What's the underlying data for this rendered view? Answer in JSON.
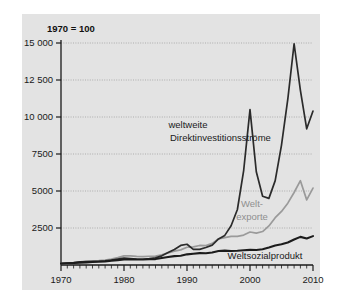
{
  "chart_data": {
    "type": "line",
    "title": "",
    "subtitle": "",
    "unit_note": "1970 = 100",
    "xlabel": "",
    "ylabel": "",
    "xlim": [
      1970,
      2010
    ],
    "ylim": [
      0,
      15000
    ],
    "grid": true,
    "legend_position": "inline-annotations",
    "x_ticks": [
      1970,
      1980,
      1990,
      2000,
      2010
    ],
    "x_tick_labels": [
      "1970",
      "1980",
      "1990",
      "2000",
      "2010"
    ],
    "x_minor_tick_step": 1,
    "y_ticks": [
      2500,
      5000,
      7500,
      10000,
      12500,
      15000
    ],
    "y_tick_labels": [
      "2500",
      "5000",
      "7500",
      "10 000",
      "12 500",
      "15 000"
    ],
    "series": [
      {
        "name": "weltweite Direktinvestitionsströme",
        "label_lines": [
          "weltweite",
          "Direktinvestitionsströme"
        ],
        "color": "#2b2b2b",
        "x": [
          1970,
          1971,
          1972,
          1973,
          1974,
          1975,
          1976,
          1977,
          1978,
          1979,
          1980,
          1981,
          1982,
          1983,
          1984,
          1985,
          1986,
          1987,
          1988,
          1989,
          1990,
          1991,
          1992,
          1993,
          1994,
          1995,
          1996,
          1997,
          1998,
          1999,
          2000,
          2001,
          2002,
          2003,
          2004,
          2005,
          2006,
          2007,
          2008,
          2009,
          2010
        ],
        "y": [
          100,
          130,
          165,
          215,
          230,
          245,
          255,
          275,
          330,
          400,
          460,
          430,
          400,
          390,
          430,
          480,
          620,
          840,
          1050,
          1320,
          1400,
          1060,
          1060,
          1180,
          1340,
          1760,
          2000,
          2650,
          3750,
          6400,
          10500,
          6300,
          4650,
          4500,
          5700,
          8100,
          11200,
          14950,
          11800,
          9200,
          10400
        ]
      },
      {
        "name": "Weltexporte",
        "label_lines": [
          "Welt-",
          "exporte"
        ],
        "color": "#9a9a9a",
        "x": [
          1970,
          1971,
          1972,
          1973,
          1974,
          1975,
          1976,
          1977,
          1978,
          1979,
          1980,
          1981,
          1982,
          1983,
          1984,
          1985,
          1986,
          1987,
          1988,
          1989,
          1990,
          1991,
          1992,
          1993,
          1994,
          1995,
          1996,
          1997,
          1998,
          1999,
          2000,
          2001,
          2002,
          2003,
          2004,
          2005,
          2006,
          2007,
          2008,
          2009,
          2010
        ],
        "y": [
          100,
          115,
          135,
          185,
          255,
          270,
          295,
          335,
          400,
          500,
          620,
          610,
          580,
          570,
          590,
          600,
          690,
          820,
          940,
          1020,
          1200,
          1230,
          1320,
          1310,
          1460,
          1760,
          1850,
          1930,
          1940,
          2020,
          2230,
          2150,
          2260,
          2640,
          3200,
          3620,
          4180,
          4900,
          5700,
          4400,
          5200
        ]
      },
      {
        "name": "Weltsozialprodukt",
        "label_lines": [
          "Weltsozialprodukt"
        ],
        "color": "#1c1c1c",
        "x": [
          1970,
          1971,
          1972,
          1973,
          1974,
          1975,
          1976,
          1977,
          1978,
          1979,
          1980,
          1981,
          1982,
          1983,
          1984,
          1985,
          1986,
          1987,
          1988,
          1989,
          1990,
          1991,
          1992,
          1993,
          1994,
          1995,
          1996,
          1997,
          1998,
          1999,
          2000,
          2001,
          2002,
          2003,
          2004,
          2005,
          2006,
          2007,
          2008,
          2009,
          2010
        ],
        "y": [
          100,
          115,
          132,
          160,
          180,
          200,
          215,
          240,
          285,
          330,
          375,
          375,
          370,
          375,
          385,
          400,
          470,
          540,
          600,
          630,
          720,
          760,
          800,
          790,
          840,
          950,
          970,
          950,
          960,
          1000,
          1020,
          1010,
          1060,
          1180,
          1320,
          1400,
          1520,
          1720,
          1900,
          1790,
          1950
        ]
      }
    ],
    "annotations": [
      {
        "name": "fdi-label",
        "text_lines": [
          "weltweite",
          "Direktinvestitionsströme"
        ],
        "color": "#1a1a1a"
      },
      {
        "name": "exports-label",
        "text_lines": [
          "Welt-",
          "exporte"
        ],
        "color": "#8f8f8f"
      },
      {
        "name": "gdp-label",
        "text_lines": [
          "Weltsozialprodukt"
        ],
        "color": "#1a1a1a"
      }
    ]
  },
  "labels": {
    "unit_note": "1970 = 100",
    "y": {
      "t2500": "2500",
      "t5000": "5000",
      "t7500": "7500",
      "t10000": "10 000",
      "t12500": "12 500",
      "t15000": "15 000"
    },
    "x": {
      "t1970": "1970",
      "t1980": "1980",
      "t1990": "1990",
      "t2000": "2000",
      "t2010": "2010"
    },
    "series": {
      "fdi_line1": "weltweite",
      "fdi_line2": "Direktinvestitionsströme",
      "exports_line1": "Welt-",
      "exports_line2": "exporte",
      "gdp_line1": "Weltsozialprodukt"
    }
  },
  "colors": {
    "panel_background": "#e3e3e3",
    "page_background": "#ffffff",
    "fdi": "#2b2b2b",
    "exports": "#9a9a9a",
    "gdp": "#1c1c1c",
    "axis": "#1a1a1a",
    "grid": "#8a8a8a"
  }
}
